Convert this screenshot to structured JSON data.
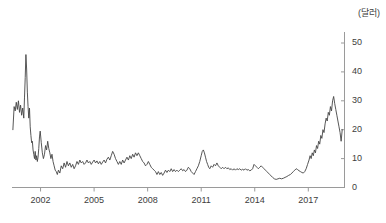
{
  "chart_data": {
    "type": "line",
    "title": "",
    "subtitle": "",
    "xlabel": "",
    "ylabel": "",
    "unit_label": "(달러)",
    "xlim": [
      2000.4,
      2019.0
    ],
    "ylim": [
      0,
      55
    ],
    "grid": false,
    "legend": null,
    "line_color": "#444444",
    "axis_color": "#9a9a9a",
    "text_color": "#3d3d3d",
    "y_ticks": [
      0,
      10,
      20,
      30,
      40,
      50
    ],
    "y_tick_labels": [
      "0",
      "10",
      "20",
      "30",
      "40",
      "50"
    ],
    "x_ticks": [
      2002,
      2005,
      2008,
      2011,
      2014,
      2017
    ],
    "x_tick_labels": [
      "2002",
      "2005",
      "2008",
      "2011",
      "2014",
      "2017"
    ],
    "series": [
      {
        "name": "price",
        "x": [
          2000.45,
          2000.52,
          2000.58,
          2000.64,
          2000.7,
          2000.76,
          2000.82,
          2000.88,
          2000.94,
          2001.0,
          2001.06,
          2001.1,
          2001.14,
          2001.18,
          2001.22,
          2001.26,
          2001.3,
          2001.34,
          2001.38,
          2001.42,
          2001.46,
          2001.5,
          2001.54,
          2001.58,
          2001.62,
          2001.66,
          2001.7,
          2001.74,
          2001.78,
          2001.82,
          2001.86,
          2001.9,
          2001.94,
          2001.98,
          2002.04,
          2002.1,
          2002.16,
          2002.22,
          2002.28,
          2002.34,
          2002.4,
          2002.46,
          2002.52,
          2002.58,
          2002.64,
          2002.7,
          2002.76,
          2002.82,
          2002.88,
          2002.94,
          2003.0,
          2003.08,
          2003.16,
          2003.24,
          2003.32,
          2003.4,
          2003.48,
          2003.56,
          2003.64,
          2003.72,
          2003.8,
          2003.88,
          2003.96,
          2004.04,
          2004.12,
          2004.2,
          2004.28,
          2004.36,
          2004.44,
          2004.52,
          2004.6,
          2004.68,
          2004.76,
          2004.84,
          2004.92,
          2005.0,
          2005.08,
          2005.16,
          2005.24,
          2005.32,
          2005.4,
          2005.48,
          2005.56,
          2005.64,
          2005.72,
          2005.8,
          2005.88,
          2005.96,
          2006.04,
          2006.12,
          2006.2,
          2006.28,
          2006.36,
          2006.44,
          2006.52,
          2006.6,
          2006.68,
          2006.76,
          2006.84,
          2006.92,
          2007.0,
          2007.08,
          2007.16,
          2007.24,
          2007.32,
          2007.4,
          2007.48,
          2007.56,
          2007.64,
          2007.72,
          2007.8,
          2007.88,
          2007.96,
          2008.04,
          2008.12,
          2008.2,
          2008.28,
          2008.36,
          2008.44,
          2008.52,
          2008.6,
          2008.68,
          2008.76,
          2008.84,
          2008.92,
          2009.0,
          2009.08,
          2009.16,
          2009.24,
          2009.32,
          2009.4,
          2009.48,
          2009.56,
          2009.64,
          2009.72,
          2009.8,
          2009.88,
          2009.96,
          2010.04,
          2010.12,
          2010.2,
          2010.28,
          2010.36,
          2010.44,
          2010.52,
          2010.6,
          2010.68,
          2010.76,
          2010.84,
          2010.92,
          2011.0,
          2011.06,
          2011.12,
          2011.18,
          2011.24,
          2011.3,
          2011.36,
          2011.42,
          2011.48,
          2011.56,
          2011.64,
          2011.72,
          2011.8,
          2011.88,
          2011.96,
          2012.04,
          2012.12,
          2012.2,
          2012.28,
          2012.36,
          2012.44,
          2012.52,
          2012.6,
          2012.68,
          2012.76,
          2012.84,
          2012.92,
          2013.0,
          2013.08,
          2013.16,
          2013.24,
          2013.32,
          2013.4,
          2013.48,
          2013.56,
          2013.64,
          2013.72,
          2013.8,
          2013.88,
          2013.96,
          2014.04,
          2014.12,
          2014.2,
          2014.28,
          2014.36,
          2014.44,
          2014.52,
          2014.6,
          2014.68,
          2014.76,
          2014.84,
          2014.92,
          2015.0,
          2015.1,
          2015.2,
          2015.3,
          2015.4,
          2015.5,
          2015.6,
          2015.7,
          2015.8,
          2015.9,
          2016.0,
          2016.08,
          2016.16,
          2016.24,
          2016.32,
          2016.4,
          2016.48,
          2016.56,
          2016.64,
          2016.72,
          2016.8,
          2016.88,
          2016.96,
          2017.04,
          2017.1,
          2017.16,
          2017.22,
          2017.28,
          2017.34,
          2017.4,
          2017.46,
          2017.52,
          2017.58,
          2017.64,
          2017.7,
          2017.76,
          2017.82,
          2017.88,
          2017.94,
          2018.0,
          2018.06,
          2018.12,
          2018.18,
          2018.24,
          2018.3,
          2018.36,
          2018.42,
          2018.48,
          2018.54,
          2018.6,
          2018.66,
          2018.72,
          2018.78,
          2018.84,
          2018.9
        ],
        "y": [
          20.0,
          28.0,
          26.5,
          29.5,
          27.0,
          30.0,
          26.0,
          28.5,
          25.0,
          27.5,
          24.0,
          31.0,
          38.0,
          46.0,
          41.0,
          33.0,
          28.0,
          24.0,
          27.5,
          21.0,
          18.0,
          15.5,
          16.0,
          13.0,
          11.5,
          10.0,
          12.5,
          9.5,
          11.0,
          9.0,
          10.5,
          13.5,
          17.5,
          19.5,
          15.5,
          12.0,
          10.0,
          11.5,
          14.5,
          13.0,
          16.0,
          13.5,
          12.0,
          10.0,
          11.5,
          9.0,
          7.5,
          6.0,
          5.5,
          4.5,
          6.0,
          5.0,
          7.5,
          6.5,
          8.5,
          7.0,
          9.0,
          7.5,
          8.5,
          7.0,
          8.0,
          6.5,
          7.5,
          9.0,
          8.0,
          9.5,
          8.5,
          9.0,
          8.0,
          8.5,
          9.5,
          8.5,
          9.0,
          8.0,
          8.8,
          9.5,
          8.5,
          9.2,
          8.2,
          9.0,
          8.0,
          8.8,
          9.5,
          8.5,
          9.8,
          10.5,
          9.5,
          11.0,
          12.5,
          11.5,
          10.0,
          9.0,
          8.0,
          9.0,
          8.0,
          9.5,
          8.5,
          9.5,
          10.5,
          9.5,
          11.0,
          10.0,
          11.5,
          10.5,
          12.0,
          11.0,
          12.0,
          11.0,
          10.0,
          9.0,
          8.5,
          7.5,
          8.0,
          9.0,
          8.0,
          7.0,
          6.5,
          6.0,
          5.5,
          4.5,
          5.5,
          4.5,
          5.2,
          4.2,
          5.0,
          6.0,
          5.2,
          6.0,
          5.5,
          6.5,
          5.5,
          6.2,
          5.5,
          6.0,
          5.5,
          6.0,
          6.5,
          5.8,
          6.2,
          5.5,
          6.0,
          7.0,
          6.5,
          5.5,
          5.0,
          4.5,
          5.5,
          6.5,
          7.5,
          9.0,
          11.0,
          12.5,
          13.0,
          12.0,
          10.5,
          9.0,
          8.0,
          7.0,
          6.5,
          7.5,
          7.0,
          8.0,
          7.5,
          8.5,
          7.5,
          7.0,
          6.5,
          7.0,
          6.5,
          7.0,
          6.5,
          6.8,
          6.2,
          6.5,
          6.0,
          6.5,
          6.0,
          6.5,
          6.2,
          6.5,
          6.0,
          6.3,
          6.0,
          6.5,
          6.0,
          6.2,
          5.8,
          6.0,
          6.5,
          8.0,
          7.5,
          7.0,
          6.5,
          7.0,
          7.5,
          7.0,
          6.5,
          6.0,
          5.5,
          5.0,
          4.5,
          4.0,
          3.5,
          3.0,
          2.8,
          3.0,
          3.2,
          3.0,
          3.2,
          3.5,
          3.8,
          4.2,
          4.5,
          5.0,
          5.5,
          6.0,
          6.5,
          6.2,
          5.8,
          5.5,
          5.2,
          5.0,
          5.5,
          6.5,
          8.0,
          9.5,
          11.0,
          10.0,
          12.0,
          11.0,
          13.0,
          12.0,
          14.5,
          13.5,
          16.0,
          15.0,
          18.0,
          17.0,
          20.0,
          19.0,
          22.0,
          24.0,
          23.0,
          26.0,
          25.0,
          28.0,
          26.5,
          30.0,
          31.5,
          29.0,
          27.0,
          25.0,
          23.0,
          21.0,
          19.0,
          16.0,
          20.0
        ]
      }
    ]
  },
  "axes": {
    "unit_label": "(달러)"
  }
}
